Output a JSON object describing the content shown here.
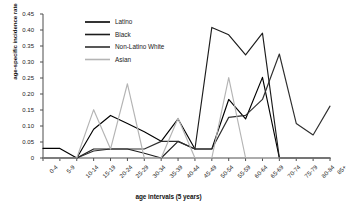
{
  "chart_data": {
    "type": "line",
    "title": "",
    "xlabel": "age intervals (5 years)",
    "ylabel": "age-specific incidence rate",
    "categories": [
      "0-4",
      "5-9",
      "10-14",
      "15-19",
      "20-24",
      "25-29",
      "30-34",
      "35-39",
      "40-44",
      "45-49",
      "50-54",
      "55-59",
      "60-64",
      "65-69",
      "70-74",
      "75-79",
      "80-84",
      "85+"
    ],
    "ylim": [
      0,
      0.45
    ],
    "ytick_labels": [
      "0.45",
      "0.40",
      "0.35",
      "0.30",
      "0.25",
      "0.20",
      "0.15",
      "0.10",
      "0.05",
      "0"
    ],
    "ytick_values": [
      0.45,
      0.4,
      0.35,
      0.3,
      0.25,
      0.2,
      0.15,
      0.1,
      0.05,
      0
    ],
    "grid": false,
    "legend_position": "top-left-inside",
    "series": [
      {
        "name": "Latino",
        "color": "#000000",
        "values": [
          0.03,
          0.03,
          0.0,
          0.09,
          0.133,
          0.108,
          0.082,
          0.052,
          0.122,
          0.028,
          0.028,
          0.183,
          0.122,
          0.252,
          0.0,
          0.0,
          0.0,
          0.0
        ]
      },
      {
        "name": "Black",
        "color": "#1c1c1c",
        "values": [
          0.0,
          0.0,
          0.0,
          0.028,
          0.028,
          0.028,
          0.015,
          0.0,
          0.052,
          0.028,
          0.408,
          0.385,
          0.322,
          0.39,
          0.0,
          0.0,
          0.0,
          0.0
        ]
      },
      {
        "name": "Non-Latino White",
        "color": "#2e2e2e",
        "values": [
          0.0,
          0.0,
          0.0,
          0.022,
          0.028,
          0.028,
          0.028,
          0.052,
          0.052,
          0.028,
          0.028,
          0.127,
          0.133,
          0.183,
          0.325,
          0.108,
          0.072,
          0.162
        ]
      },
      {
        "name": "Asian",
        "color": "#b4b4b4",
        "values": [
          0.0,
          0.0,
          0.0,
          0.151,
          0.028,
          0.232,
          0.0,
          0.0,
          0.124,
          0.0,
          0.0,
          0.251,
          0.0,
          0.0,
          0.0,
          0.0,
          0.0,
          0.0
        ]
      }
    ]
  },
  "legend": {
    "items": [
      {
        "label": "Latino"
      },
      {
        "label": "Black"
      },
      {
        "label": "Non-Latino White"
      },
      {
        "label": "Asian"
      }
    ]
  }
}
